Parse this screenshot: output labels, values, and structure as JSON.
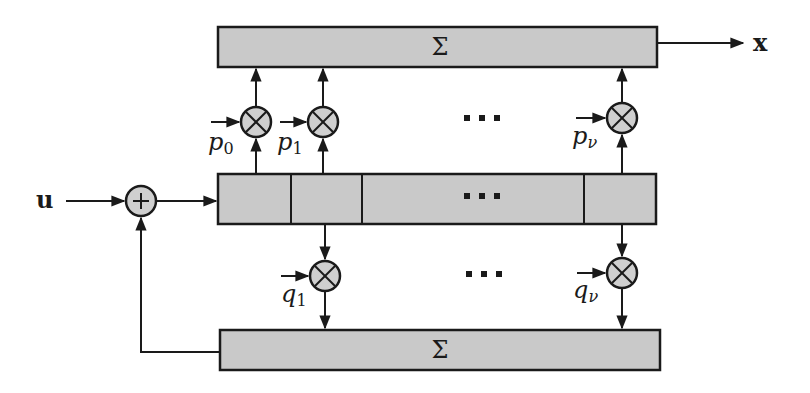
{
  "diagram": {
    "type": "block-diagram",
    "input_label": "u",
    "output_label": "x",
    "top_sum": {
      "label": "Σ"
    },
    "bottom_sum": {
      "label": "Σ"
    },
    "register": {
      "cells": 4,
      "ellipsis": "⋯"
    },
    "adder": {
      "symbol": "+"
    },
    "top_taps": [
      {
        "label": "p",
        "subscript": "0"
      },
      {
        "label": "p",
        "subscript": "1"
      },
      {
        "label": "p",
        "subscript": "ν"
      }
    ],
    "bottom_taps": [
      {
        "label": "q",
        "subscript": "1"
      },
      {
        "label": "q",
        "subscript": "ν"
      }
    ],
    "ellipsis_top": "⋯",
    "ellipsis_bottom": "⋯",
    "colors": {
      "block_fill": "#c9c9c9",
      "stroke": "#1a1a1a",
      "background": "#ffffff"
    }
  }
}
